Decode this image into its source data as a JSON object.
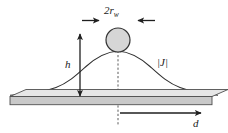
{
  "figure": {
    "background_color": "#ffffff",
    "labels": {
      "wire_diameter_prefix": "2",
      "wire_radius_symbol": "r",
      "wire_radius_subscript": "w",
      "height_symbol": "h",
      "current_density_symbol": "|J|",
      "distance_symbol": "d"
    },
    "colors": {
      "wire_fill": "#d6d6d6",
      "wire_stroke": "#333333",
      "slab_face": "#c9c9c9",
      "slab_top": "#e6e6e6",
      "slab_stroke": "#4f4f4f",
      "curve_stroke": "#2f2f2f",
      "dash_stroke": "#4a4a4a",
      "arrow_stroke": "#1f1f1f",
      "text": "#1a1a1a"
    },
    "geometry": {
      "wire_center_x": 118,
      "wire_center_y": 40,
      "wire_radius": 12,
      "curve_peak_x": 118,
      "curve_peak_y": 51,
      "slab_left_x": 10,
      "slab_right_x": 218,
      "slab_top_y": 96,
      "slab_bottom_y": 106,
      "height_arrow_x": 80,
      "height_arrow_top_y": 33,
      "height_arrow_bottom_y": 96,
      "distance_arrow_y": 113,
      "distance_arrow_start_x": 120,
      "distance_arrow_end_x": 201,
      "dash_line_x": 118,
      "dash_line_top_y": 34,
      "dash_line_bottom_y": 126,
      "diameter_arrow_y": 20,
      "diameter_arrow_left_start_x": 82,
      "diameter_arrow_left_end_x": 99,
      "diameter_arrow_right_start_x": 155,
      "diameter_arrow_right_end_x": 138
    }
  }
}
